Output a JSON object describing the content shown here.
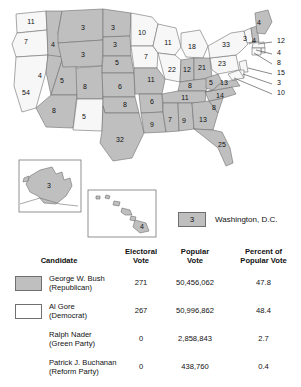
{
  "map": {
    "legend": {
      "dc_value": "3",
      "dc_label": "Washington, D.C."
    },
    "insets": {
      "alaska": {
        "value": "3"
      },
      "hawaii": {
        "value": "4"
      }
    },
    "states": [
      {
        "code": "WA",
        "label": "11",
        "winner": "gore",
        "x": 31,
        "y": 22
      },
      {
        "code": "OR",
        "label": "7",
        "winner": "gore",
        "x": 26,
        "y": 42
      },
      {
        "code": "CA",
        "label": "54",
        "winner": "gore",
        "x": 26,
        "y": 93
      },
      {
        "code": "ID",
        "label": "4",
        "winner": "bush",
        "x": 53,
        "y": 45
      },
      {
        "code": "NV",
        "label": "4",
        "winner": "bush",
        "x": 40,
        "y": 76
      },
      {
        "code": "UT",
        "label": "5",
        "winner": "bush",
        "x": 62,
        "y": 81
      },
      {
        "code": "AZ",
        "label": "8",
        "winner": "bush",
        "x": 54,
        "y": 111
      },
      {
        "code": "MT",
        "label": "3",
        "winner": "bush",
        "x": 83,
        "y": 28
      },
      {
        "code": "WY",
        "label": "3",
        "winner": "bush",
        "x": 83,
        "y": 55
      },
      {
        "code": "CO",
        "label": "8",
        "winner": "bush",
        "x": 85,
        "y": 87
      },
      {
        "code": "NM",
        "label": "5",
        "winner": "gore",
        "x": 84,
        "y": 117
      },
      {
        "code": "ND",
        "label": "3",
        "winner": "bush",
        "x": 113,
        "y": 28
      },
      {
        "code": "SD",
        "label": "3",
        "winner": "bush",
        "x": 115,
        "y": 45
      },
      {
        "code": "NE",
        "label": "5",
        "winner": "bush",
        "x": 117,
        "y": 63
      },
      {
        "code": "KS",
        "label": "6",
        "winner": "bush",
        "x": 120,
        "y": 87
      },
      {
        "code": "OK",
        "label": "8",
        "winner": "bush",
        "x": 125,
        "y": 105
      },
      {
        "code": "TX",
        "label": "32",
        "winner": "bush",
        "x": 120,
        "y": 140
      },
      {
        "code": "MN",
        "label": "10",
        "winner": "gore",
        "x": 142,
        "y": 33
      },
      {
        "code": "IA",
        "label": "7",
        "winner": "gore",
        "x": 146,
        "y": 57
      },
      {
        "code": "MO",
        "label": "11",
        "winner": "bush",
        "x": 151,
        "y": 80
      },
      {
        "code": "AR",
        "label": "6",
        "winner": "bush",
        "x": 152,
        "y": 102
      },
      {
        "code": "LA",
        "label": "9",
        "winner": "bush",
        "x": 152,
        "y": 125
      },
      {
        "code": "WI",
        "label": "11",
        "winner": "gore",
        "x": 168,
        "y": 43
      },
      {
        "code": "MI",
        "label": "18",
        "winner": "gore",
        "x": 192,
        "y": 47
      },
      {
        "code": "IL",
        "label": "22",
        "winner": "gore",
        "x": 172,
        "y": 70
      },
      {
        "code": "IN",
        "label": "12",
        "winner": "bush",
        "x": 187,
        "y": 70
      },
      {
        "code": "OH",
        "label": "21",
        "winner": "bush",
        "x": 202,
        "y": 68
      },
      {
        "code": "KY",
        "label": "8",
        "winner": "bush",
        "x": 190,
        "y": 86
      },
      {
        "code": "TN",
        "label": "11",
        "winner": "bush",
        "x": 185,
        "y": 98
      },
      {
        "code": "MS",
        "label": "7",
        "winner": "bush",
        "x": 170,
        "y": 120
      },
      {
        "code": "AL",
        "label": "9",
        "winner": "bush",
        "x": 184,
        "y": 121
      },
      {
        "code": "GA",
        "label": "13",
        "winner": "bush",
        "x": 203,
        "y": 120
      },
      {
        "code": "SC",
        "label": "8",
        "winner": "bush",
        "x": 214,
        "y": 108
      },
      {
        "code": "NC",
        "label": "14",
        "winner": "bush",
        "x": 220,
        "y": 96
      },
      {
        "code": "WV",
        "label": "5",
        "winner": "bush",
        "x": 211,
        "y": 83
      },
      {
        "code": "VA",
        "label": "13",
        "winner": "bush",
        "x": 224,
        "y": 83
      },
      {
        "code": "PA",
        "label": "23",
        "winner": "gore",
        "x": 222,
        "y": 64
      },
      {
        "code": "NY",
        "label": "33",
        "winner": "gore",
        "x": 226,
        "y": 45
      },
      {
        "code": "ME",
        "label": "4",
        "winner": "gore",
        "x": 259,
        "y": 23
      },
      {
        "code": "FL",
        "label": "25",
        "winner": "bush",
        "x": 222,
        "y": 145
      }
    ],
    "leader_labels": [
      {
        "state": "VT",
        "label": "3",
        "x": 243,
        "y": 39
      },
      {
        "state": "NH",
        "label": "4",
        "x": 252,
        "y": 41
      },
      {
        "state": "MA",
        "label": "12",
        "x": 277,
        "y": 41
      },
      {
        "state": "RI",
        "label": "4",
        "x": 277,
        "y": 53
      },
      {
        "state": "CT",
        "label": "8",
        "x": 277,
        "y": 63
      },
      {
        "state": "NJ",
        "label": "15",
        "x": 277,
        "y": 73
      },
      {
        "state": "DE",
        "label": "3",
        "x": 277,
        "y": 83
      },
      {
        "state": "MD",
        "label": "10",
        "x": 277,
        "y": 93
      }
    ]
  },
  "table": {
    "headers": {
      "candidate": "Candidate",
      "electoral_vote": "Electoral\nVote",
      "electoral_vote_l1": "Electoral",
      "electoral_vote_l2": "Vote",
      "popular_vote_l1": "Popular",
      "popular_vote_l2": "Vote",
      "percent_l1": "Percent of",
      "percent_l2": "Popular Vote"
    },
    "rows": [
      {
        "name": "George W. Bush",
        "party": "(Republican)",
        "electoral_vote": "271",
        "popular_vote": "50,456,062",
        "percent": "47.8",
        "swatch": "#bfbfbf",
        "has_swatch": true
      },
      {
        "name": "Al Gore",
        "party": "(Democrat)",
        "electoral_vote": "267",
        "popular_vote": "50,996,862",
        "percent": "48.4",
        "swatch": "#ffffff",
        "has_swatch": true
      },
      {
        "name": "Ralph Nader",
        "party": "(Green Party)",
        "electoral_vote": "0",
        "popular_vote": "2,858,843",
        "percent": "2.7",
        "swatch": "",
        "has_swatch": false
      },
      {
        "name": "Patrick J. Buchanan",
        "party": "(Reform Party)",
        "electoral_vote": "0",
        "popular_vote": "438,760",
        "percent": "0.4",
        "swatch": "",
        "has_swatch": false
      }
    ]
  },
  "colors": {
    "bush_fill": "#bfbfbf",
    "gore_fill": "#f7f7f7",
    "border": "#6e6e6e",
    "text": "#111111"
  }
}
